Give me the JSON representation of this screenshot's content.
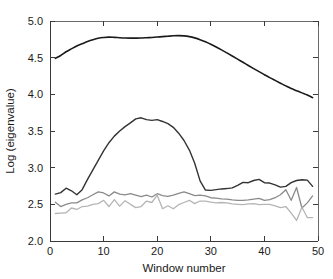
{
  "chart_data": {
    "type": "line",
    "title": "",
    "subtitle": "",
    "xlabel": "Window number",
    "ylabel": "Log (eigenvalue)",
    "xlim": [
      0,
      50
    ],
    "ylim": [
      2.0,
      5.0
    ],
    "xticks": [
      0,
      10,
      20,
      30,
      40,
      50
    ],
    "xtick_labels": [
      "0",
      "10",
      "20",
      "30",
      "40",
      "50"
    ],
    "yticks": [
      2.0,
      2.5,
      3.0,
      3.5,
      4.0,
      4.5,
      5.0
    ],
    "ytick_labels": [
      "2.0",
      "2.5",
      "3.0",
      "3.5",
      "4.0",
      "4.5",
      "5.0"
    ],
    "grid": false,
    "legend": false,
    "legend_position": "none",
    "x": [
      1,
      2,
      3,
      4,
      5,
      6,
      7,
      8,
      9,
      10,
      11,
      12,
      13,
      14,
      15,
      16,
      17,
      18,
      19,
      20,
      21,
      22,
      23,
      24,
      25,
      26,
      27,
      28,
      29,
      30,
      31,
      32,
      33,
      34,
      35,
      36,
      37,
      38,
      39,
      40,
      41,
      42,
      43,
      44,
      45,
      46,
      47,
      48,
      49
    ],
    "series": [
      {
        "name": "eigenvalue-1",
        "color": "#1a1a1a",
        "width": 1.6,
        "values": [
          4.49,
          4.53,
          4.58,
          4.62,
          4.66,
          4.69,
          4.72,
          4.745,
          4.765,
          4.775,
          4.78,
          4.777,
          4.772,
          4.768,
          4.766,
          4.766,
          4.768,
          4.772,
          4.776,
          4.781,
          4.787,
          4.793,
          4.798,
          4.8,
          4.797,
          4.787,
          4.77,
          4.746,
          4.716,
          4.682,
          4.645,
          4.606,
          4.565,
          4.523,
          4.48,
          4.437,
          4.394,
          4.351,
          4.309,
          4.268,
          4.228,
          4.19,
          4.152,
          4.115,
          4.08,
          4.05,
          4.02,
          3.99,
          3.955
        ]
      },
      {
        "name": "eigenvalue-2",
        "color": "#333333",
        "width": 1.4,
        "values": [
          2.64,
          2.66,
          2.72,
          2.685,
          2.63,
          2.7,
          2.84,
          2.97,
          3.1,
          3.23,
          3.34,
          3.43,
          3.5,
          3.56,
          3.61,
          3.665,
          3.68,
          3.655,
          3.645,
          3.655,
          3.63,
          3.6,
          3.55,
          3.47,
          3.37,
          3.24,
          3.06,
          2.82,
          2.695,
          2.69,
          2.7,
          2.71,
          2.715,
          2.725,
          2.76,
          2.8,
          2.795,
          2.825,
          2.84,
          2.795,
          2.79,
          2.765,
          2.735,
          2.745,
          2.795,
          2.825,
          2.835,
          2.83,
          2.745
        ]
      },
      {
        "name": "eigenvalue-3",
        "color": "#8a8a8a",
        "width": 1.3,
        "values": [
          2.53,
          2.47,
          2.5,
          2.52,
          2.52,
          2.56,
          2.59,
          2.63,
          2.67,
          2.655,
          2.615,
          2.67,
          2.64,
          2.63,
          2.645,
          2.625,
          2.605,
          2.625,
          2.6,
          2.645,
          2.62,
          2.61,
          2.625,
          2.65,
          2.67,
          2.645,
          2.62,
          2.625,
          2.615,
          2.59,
          2.585,
          2.575,
          2.57,
          2.56,
          2.555,
          2.555,
          2.56,
          2.57,
          2.58,
          2.555,
          2.565,
          2.59,
          2.63,
          2.7,
          2.555,
          2.73,
          2.45,
          2.52,
          2.615
        ]
      },
      {
        "name": "eigenvalue-4",
        "color": "#b5b5b5",
        "width": 1.3,
        "values": [
          2.375,
          2.38,
          2.385,
          2.45,
          2.43,
          2.47,
          2.475,
          2.5,
          2.51,
          2.555,
          2.47,
          2.565,
          2.475,
          2.55,
          2.5,
          2.455,
          2.47,
          2.545,
          2.525,
          2.625,
          2.44,
          2.48,
          2.44,
          2.495,
          2.525,
          2.555,
          2.51,
          2.545,
          2.545,
          2.53,
          2.52,
          2.525,
          2.52,
          2.505,
          2.5,
          2.495,
          2.505,
          2.51,
          2.495,
          2.5,
          2.5,
          2.48,
          2.455,
          2.47,
          2.38,
          2.28,
          2.46,
          2.32,
          2.32
        ]
      }
    ]
  }
}
